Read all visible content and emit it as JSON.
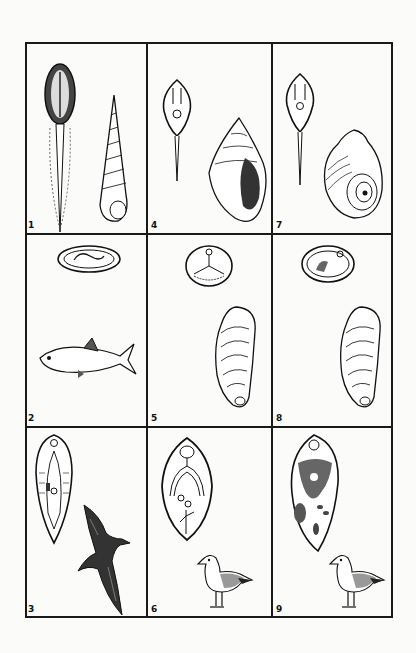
{
  "figure": {
    "layout": {
      "rows": 3,
      "columns": 3
    },
    "panels": [
      {
        "number": "1",
        "row": 1,
        "col": 1,
        "parasite": "cercaria (elongate body with tail)",
        "host": "high-spired snail (turret shell)"
      },
      {
        "number": "2",
        "row": 2,
        "col": 1,
        "parasite": "encysted metacercaria",
        "host": "fish"
      },
      {
        "number": "3",
        "row": 3,
        "col": 1,
        "parasite": "adult fluke (elongate)",
        "host": "seabird in flight"
      },
      {
        "number": "4",
        "row": 1,
        "col": 2,
        "parasite": "cercaria with tail",
        "host": "whelk-type snail"
      },
      {
        "number": "5",
        "row": 2,
        "col": 2,
        "parasite": "encysted metacercaria (round)",
        "host": "mussel"
      },
      {
        "number": "6",
        "row": 3,
        "col": 2,
        "parasite": "adult fluke (oval)",
        "host": "gull"
      },
      {
        "number": "7",
        "row": 1,
        "col": 3,
        "parasite": "cercaria with tail",
        "host": "periwinkle snail"
      },
      {
        "number": "8",
        "row": 2,
        "col": 3,
        "parasite": "encysted metacercaria",
        "host": "mussel"
      },
      {
        "number": "9",
        "row": 3,
        "col": 3,
        "parasite": "adult fluke with dense vitellaria",
        "host": "gull"
      }
    ]
  },
  "colors": {
    "line": "#1a1a1a",
    "background": "#fbfbf9",
    "shade": "#555555"
  }
}
